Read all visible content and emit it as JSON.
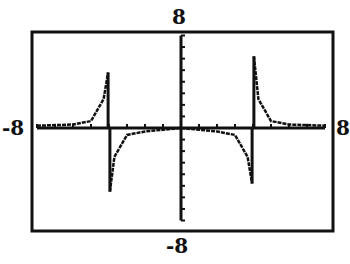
{
  "chart_data": {
    "type": "line",
    "title": "",
    "xlabel": "",
    "ylabel": "",
    "xlim": [
      -8,
      8
    ],
    "ylim": [
      -8,
      8
    ],
    "window_labels": {
      "ymax": "8",
      "ymin": "-8",
      "xmin": "-8",
      "xmax": "8"
    },
    "grid": false,
    "tick_interval": 1,
    "vertical_asymptotes": [
      -4,
      4
    ],
    "horizontal_asymptote": 0,
    "series": [
      {
        "name": "f(x)",
        "description": "rational function with vertical asymptotes near x=-4 and x=4, approaching y=0 far from asymptotes",
        "points": [
          {
            "x": -8,
            "y": 0.2
          },
          {
            "x": -6,
            "y": 0.3
          },
          {
            "x": -5,
            "y": 0.6
          },
          {
            "x": -4.3,
            "y": 2.5
          },
          {
            "x": -4.05,
            "y": 4.8
          },
          {
            "x": -3.95,
            "y": -5.5
          },
          {
            "x": -3.7,
            "y": -2.5
          },
          {
            "x": -3,
            "y": -0.6
          },
          {
            "x": -2,
            "y": -0.3
          },
          {
            "x": 0,
            "y": 0
          },
          {
            "x": 2,
            "y": -0.3
          },
          {
            "x": 3,
            "y": -0.6
          },
          {
            "x": 3.7,
            "y": -2.5
          },
          {
            "x": 3.95,
            "y": -4.8
          },
          {
            "x": 4.05,
            "y": 6.2
          },
          {
            "x": 4.3,
            "y": 2.5
          },
          {
            "x": 5,
            "y": 0.6
          },
          {
            "x": 6,
            "y": 0.3
          },
          {
            "x": 8,
            "y": 0.2
          }
        ]
      }
    ]
  }
}
